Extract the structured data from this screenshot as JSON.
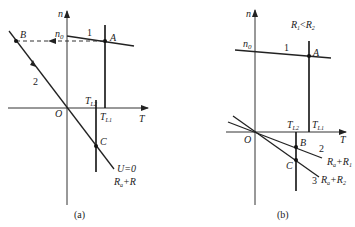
{
  "panel_a": {
    "caption": "(a)",
    "axis_n": "n",
    "axis_T": "T",
    "origin": "O",
    "n0": "n",
    "n0_sub": "0",
    "curve1_label": "1",
    "curve2_label": "2",
    "point_A": "A",
    "point_B": "B",
    "point_C": "C",
    "TL2": "T",
    "TL2_sub": "L2",
    "TL1": "T",
    "TL1_sub": "L1",
    "condition": "U=0",
    "resistance_main": "R",
    "resistance_sub": "a",
    "resistance_rest": "+R"
  },
  "panel_b": {
    "caption": "(b)",
    "axis_n": "n",
    "axis_T": "T",
    "origin": "O",
    "n0": "n",
    "n0_sub": "0",
    "relation_R1": "R",
    "relation_R1_sub": "1",
    "relation_op": "<",
    "relation_R2": "R",
    "relation_R2_sub": "2",
    "curve1_label": "1",
    "curve2_label": "2",
    "curve3_label": "3",
    "point_A": "A",
    "point_B": "B",
    "point_C": "C",
    "TL2": "T",
    "TL2_sub": "L2",
    "TL1": "T",
    "TL1_sub": "L1",
    "res2_main": "R",
    "res2_sub": "a",
    "res2_plus": "+R",
    "res2_sub2": "1",
    "res3_main": "R",
    "res3_sub": "a",
    "res3_plus": "+R",
    "res3_sub2": "2"
  }
}
